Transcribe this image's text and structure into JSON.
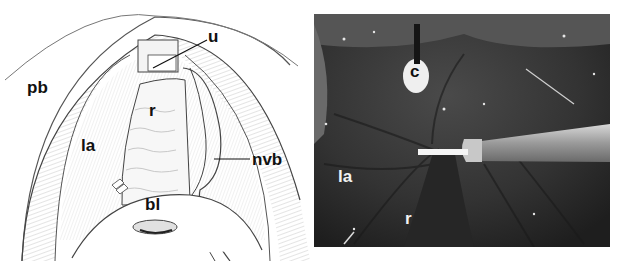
{
  "figure": {
    "left_panel": {
      "type": "illustration",
      "labels": {
        "pb": "pb",
        "u": "u",
        "r": "r",
        "la": "la",
        "nvb": "nvb",
        "bl": "bl"
      }
    },
    "right_panel": {
      "type": "photograph",
      "labels": {
        "c": "c",
        "la": "la",
        "r": "r"
      }
    }
  }
}
